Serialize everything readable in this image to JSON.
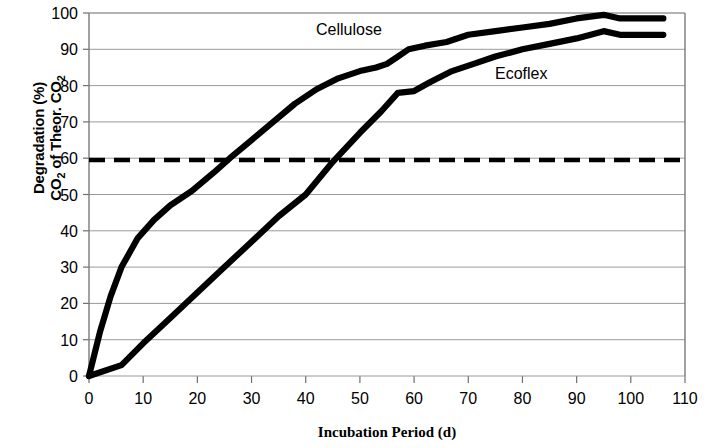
{
  "chart_data": {
    "type": "line",
    "title": "",
    "xlabel": "Incubation Period (d)",
    "ylabel_line1": "Degradation (%)",
    "ylabel_line2_pre": "CO",
    "ylabel_line2_sub1": "2",
    "ylabel_line2_mid": " of Theor. CO",
    "ylabel_line2_sub2": "2",
    "xlim": [
      0,
      110
    ],
    "ylim": [
      0,
      100
    ],
    "xticks": [
      0,
      10,
      20,
      30,
      40,
      50,
      60,
      70,
      80,
      90,
      100,
      110
    ],
    "yticks": [
      0,
      10,
      20,
      30,
      40,
      50,
      60,
      70,
      80,
      90,
      100
    ],
    "xtick_labels": [
      "0",
      "10",
      "20",
      "30",
      "40",
      "50",
      "60",
      "70",
      "80",
      "90",
      "100",
      "110"
    ],
    "ytick_labels": [
      "0",
      "10",
      "20",
      "30",
      "40",
      "50",
      "60",
      "70",
      "80",
      "90",
      "100"
    ],
    "grid": "horizontal",
    "legend_position": "inline-annotations",
    "reference_line": {
      "label": "60% pass level",
      "y": 59.5,
      "style": "dashed",
      "color": "#000000"
    },
    "series": [
      {
        "name": "Cellulose",
        "color": "#000000",
        "label_x": 42,
        "label_y": 96,
        "points": [
          [
            0,
            0
          ],
          [
            2,
            12
          ],
          [
            4,
            22
          ],
          [
            6,
            30
          ],
          [
            9,
            38
          ],
          [
            12,
            43
          ],
          [
            15,
            47
          ],
          [
            19,
            51
          ],
          [
            23,
            56
          ],
          [
            26,
            60
          ],
          [
            30,
            65
          ],
          [
            34,
            70
          ],
          [
            38,
            75
          ],
          [
            42,
            79
          ],
          [
            46,
            82
          ],
          [
            50,
            84
          ],
          [
            53,
            85
          ],
          [
            55,
            86
          ],
          [
            57,
            88
          ],
          [
            59,
            90
          ],
          [
            62,
            91
          ],
          [
            66,
            92
          ],
          [
            70,
            94
          ],
          [
            75,
            95
          ],
          [
            80,
            96
          ],
          [
            85,
            97
          ],
          [
            90,
            98.5
          ],
          [
            95,
            99.5
          ],
          [
            98,
            98.5
          ],
          [
            106,
            98.5
          ]
        ]
      },
      {
        "name": "Ecoflex",
        "color": "#000000",
        "label_x": 76,
        "label_y": 87,
        "points": [
          [
            0,
            0
          ],
          [
            6,
            3
          ],
          [
            10,
            9
          ],
          [
            15,
            16
          ],
          [
            20,
            23
          ],
          [
            25,
            30
          ],
          [
            30,
            37
          ],
          [
            35,
            44
          ],
          [
            40,
            50
          ],
          [
            45,
            59
          ],
          [
            50,
            67
          ],
          [
            54,
            73
          ],
          [
            57,
            78
          ],
          [
            60,
            78.5
          ],
          [
            63,
            81
          ],
          [
            67,
            84
          ],
          [
            71,
            86
          ],
          [
            75,
            88
          ],
          [
            80,
            90
          ],
          [
            85,
            91.5
          ],
          [
            90,
            93
          ],
          [
            95,
            95
          ],
          [
            98,
            94
          ],
          [
            106,
            94
          ]
        ]
      }
    ]
  }
}
